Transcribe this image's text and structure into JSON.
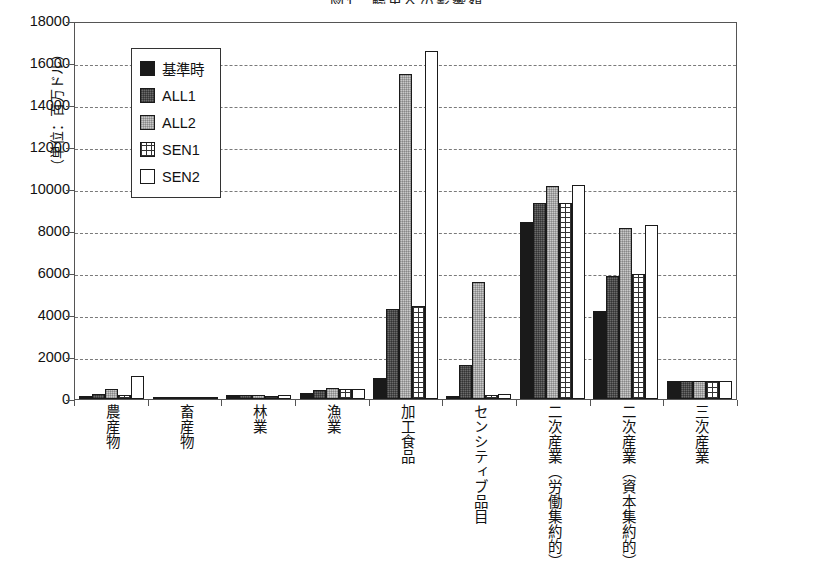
{
  "title": "図1　輸出への影響額",
  "axis": {
    "y_unit_label": "（単位：百万ドル）",
    "y_ticks": [
      "18000",
      "16000",
      "14000",
      "12000",
      "10000",
      "8000",
      "6000",
      "4000",
      "2000",
      "0"
    ]
  },
  "legend": {
    "items": [
      {
        "label": "基準時",
        "swatch": "solid-black",
        "color": "#1a1a1a"
      },
      {
        "label": "ALL1",
        "swatch": "dark-gray-dither",
        "color": "#6b6b6b"
      },
      {
        "label": "ALL2",
        "swatch": "light-gray-dither",
        "color": "#c9c9c9"
      },
      {
        "label": "SEN1",
        "swatch": "cross-hatch",
        "color": "#ffffff"
      },
      {
        "label": "SEN2",
        "swatch": "white-empty",
        "color": "#ffffff"
      }
    ]
  },
  "chart_data": {
    "type": "bar",
    "title": "図1　輸出への影響額",
    "xlabel": "",
    "ylabel": "（単位：百万ドル）",
    "ylim": [
      0,
      18000
    ],
    "ytick_step": 2000,
    "grid": true,
    "legend_position": "upper-left-inside",
    "categories": [
      "農産物",
      "畜産物",
      "林業",
      "漁業",
      "加工食品",
      "センシティブ品目",
      "二次産業（労働集約的）",
      "二次産業（資本集約的）",
      "三次産業"
    ],
    "series": [
      {
        "name": "基準時",
        "values": [
          130,
          10,
          170,
          300,
          1000,
          150,
          8450,
          4200,
          880
        ]
      },
      {
        "name": "ALL1",
        "values": [
          230,
          10,
          200,
          430,
          4300,
          1600,
          9350,
          5850,
          860
        ]
      },
      {
        "name": "ALL2",
        "values": [
          480,
          10,
          180,
          520,
          15500,
          5550,
          10150,
          8150,
          840
        ]
      },
      {
        "name": "SEN1",
        "values": [
          200,
          10,
          160,
          500,
          4450,
          200,
          9350,
          5950,
          870
        ]
      },
      {
        "name": "SEN2",
        "values": [
          1080,
          10,
          170,
          480,
          16550,
          250,
          10200,
          8300,
          860
        ]
      }
    ]
  }
}
